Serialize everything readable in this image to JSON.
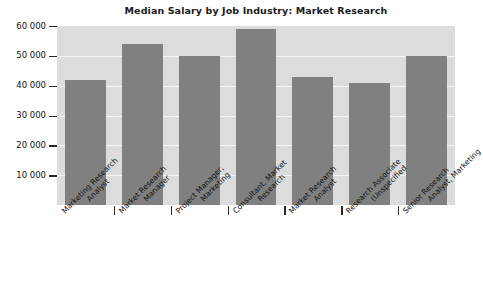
{
  "chart_data": {
    "type": "bar",
    "title": "Median Salary by Job Industry: Market Research",
    "xlabel": "",
    "ylabel": "",
    "ylim": [
      0,
      60000
    ],
    "grid": true,
    "legend": "none",
    "y_ticks": [
      10000,
      20000,
      30000,
      40000,
      50000,
      60000
    ],
    "y_tick_labels": [
      "10 000",
      "20 000",
      "30 000",
      "40 000",
      "50 000",
      "60 000"
    ],
    "categories": [
      "Marketing Research Analyst",
      "Market Research Manager",
      "Project Manager, Marketing",
      "Consultant, Market Research",
      "Market Research Analyst",
      "Research Associate (Unspecified",
      "Senior Research Analyst, Marketing"
    ],
    "category_lines": [
      [
        "Marketing Research",
        "Analyst"
      ],
      [
        "Market Research",
        "Manager"
      ],
      [
        "Project Manager,",
        "Marketing"
      ],
      [
        "Consultant, Market",
        "Research"
      ],
      [
        "Market Research",
        "Analyst"
      ],
      [
        "Research Associate",
        "(Unspecified"
      ],
      [
        "Senior Research",
        "Analyst, Marketing"
      ]
    ],
    "values": [
      42000,
      54000,
      50000,
      59000,
      43000,
      41000,
      50000
    ],
    "colors": {
      "bar": "#808080",
      "plot_background": "#dcdcdc",
      "gridline": "#f4f4f4",
      "page_background": "#ffffff",
      "text": "#111111"
    }
  }
}
